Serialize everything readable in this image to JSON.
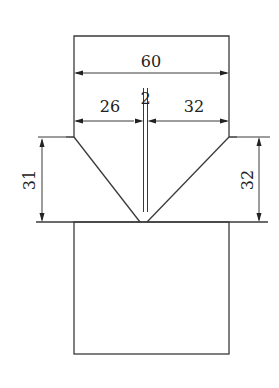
{
  "diagram": {
    "type": "technical-drawing",
    "colors": {
      "line": "#3a3a3a",
      "text": "#222222",
      "background": "#ffffff"
    },
    "dimensions": {
      "total_width": {
        "label": "60",
        "orientation": "horizontal"
      },
      "left_segment": {
        "label": "26",
        "orientation": "horizontal"
      },
      "slot_width": {
        "label": "2",
        "orientation": "horizontal"
      },
      "right_segment": {
        "label": "32",
        "orientation": "horizontal"
      },
      "left_bevel_height": {
        "label": "31",
        "orientation": "vertical"
      },
      "right_bevel_height": {
        "label": "32",
        "orientation": "vertical"
      }
    }
  }
}
